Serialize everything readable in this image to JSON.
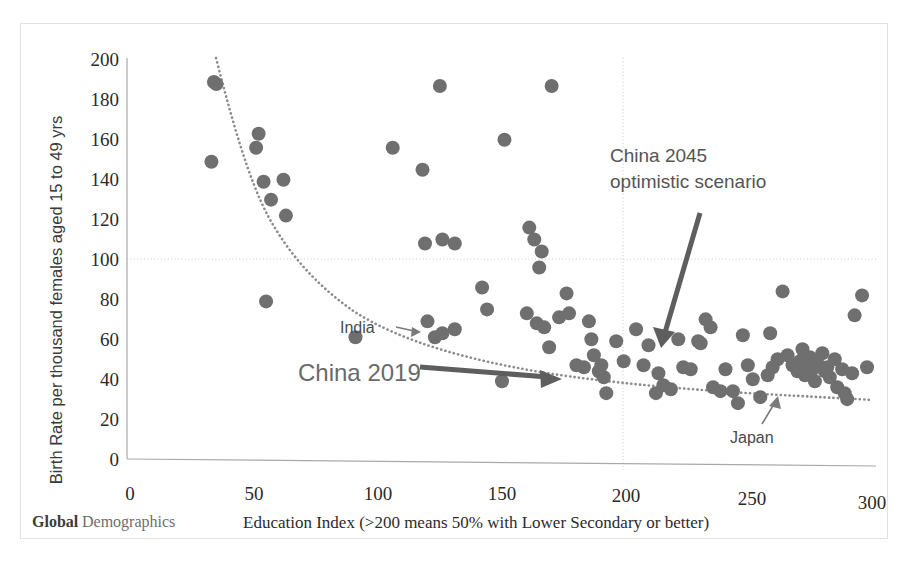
{
  "figure": {
    "brand_bold": "Global",
    "brand_light": "Demographics"
  },
  "chart_data": {
    "type": "scatter",
    "title": "",
    "xlabel": "Education Index (>200 means 50% with Lower Secondary or better)",
    "ylabel": "Birth Rate per thousand females aged 15 to 49 yrs",
    "xlim": [
      0,
      300
    ],
    "ylim": [
      0,
      200
    ],
    "xticks": [
      0,
      50,
      100,
      150,
      200,
      250,
      300
    ],
    "yticks": [
      0,
      20,
      40,
      60,
      80,
      100,
      120,
      140,
      160,
      180,
      200
    ],
    "grid": "horizontal gridline at y=100 and vertical gridline at x=200",
    "legend": "none",
    "marker_color": "#6f6f6f",
    "points": [
      [
        35,
        189
      ],
      [
        36,
        188
      ],
      [
        34,
        149
      ],
      [
        52,
        156
      ],
      [
        53,
        163
      ],
      [
        55,
        139
      ],
      [
        56,
        79
      ],
      [
        58,
        130
      ],
      [
        63,
        140
      ],
      [
        64,
        122
      ],
      [
        92,
        61
      ],
      [
        107,
        156
      ],
      [
        119,
        145
      ],
      [
        120,
        108
      ],
      [
        126,
        187
      ],
      [
        127,
        110
      ],
      [
        132,
        108
      ],
      [
        121,
        69
      ],
      [
        124,
        61
      ],
      [
        127,
        63
      ],
      [
        132,
        65
      ],
      [
        143,
        86
      ],
      [
        145,
        75
      ],
      [
        151,
        39
      ],
      [
        152,
        160
      ],
      [
        162,
        116
      ],
      [
        164,
        110
      ],
      [
        166,
        96
      ],
      [
        167,
        104
      ],
      [
        161,
        73
      ],
      [
        165,
        68
      ],
      [
        168,
        66
      ],
      [
        171,
        187
      ],
      [
        170,
        56
      ],
      [
        174,
        71
      ],
      [
        177,
        83
      ],
      [
        178,
        73
      ],
      [
        181,
        47
      ],
      [
        184,
        46
      ],
      [
        187,
        60
      ],
      [
        188,
        52
      ],
      [
        190,
        44
      ],
      [
        191,
        47
      ],
      [
        192,
        41
      ],
      [
        193,
        33
      ],
      [
        186,
        69
      ],
      [
        197,
        59
      ],
      [
        200,
        49
      ],
      [
        205,
        65
      ],
      [
        208,
        47
      ],
      [
        210,
        57
      ],
      [
        214,
        43
      ],
      [
        216,
        37
      ],
      [
        219,
        35
      ],
      [
        222,
        60
      ],
      [
        224,
        46
      ],
      [
        227,
        45
      ],
      [
        230,
        59
      ],
      [
        231,
        58
      ],
      [
        233,
        70
      ],
      [
        236,
        36
      ],
      [
        239,
        34
      ],
      [
        241,
        45
      ],
      [
        244,
        34
      ],
      [
        246,
        28
      ],
      [
        248,
        62
      ],
      [
        250,
        47
      ],
      [
        252,
        40
      ],
      [
        255,
        31
      ],
      [
        258,
        42
      ],
      [
        260,
        46
      ],
      [
        262,
        50
      ],
      [
        264,
        84
      ],
      [
        266,
        52
      ],
      [
        268,
        47
      ],
      [
        270,
        44
      ],
      [
        271,
        49
      ],
      [
        272,
        55
      ],
      [
        273,
        42
      ],
      [
        274,
        47
      ],
      [
        275,
        51
      ],
      [
        276,
        45
      ],
      [
        277,
        39
      ],
      [
        278,
        48
      ],
      [
        280,
        53
      ],
      [
        281,
        44
      ],
      [
        282,
        46
      ],
      [
        283,
        41
      ],
      [
        285,
        50
      ],
      [
        286,
        36
      ],
      [
        288,
        45
      ],
      [
        290,
        30
      ],
      [
        292,
        43
      ],
      [
        293,
        72
      ],
      [
        296,
        82
      ],
      [
        298,
        46
      ],
      [
        289,
        33
      ],
      [
        259,
        63
      ],
      [
        213,
        33
      ],
      [
        235,
        66
      ]
    ],
    "trendline": {
      "type": "power-decay",
      "description": "dotted decreasing curve from (38,200) to (300,40)"
    },
    "annotations": [
      {
        "id": "china-2045",
        "line1": "China 2045",
        "line2": "optimistic scenario"
      },
      {
        "id": "china-2019",
        "text": "China 2019"
      },
      {
        "id": "india",
        "text": "India"
      },
      {
        "id": "japan",
        "text": "Japan"
      }
    ]
  }
}
